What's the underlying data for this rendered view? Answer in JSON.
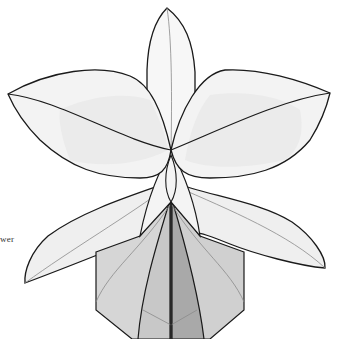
{
  "diagram": {
    "caption_fragment": "wer",
    "colors": {
      "outline": "#1a1a1a",
      "crease": "#8a8a8a",
      "petal_fill": "#f2f2f2",
      "petal_shade": "#e9e9e9",
      "pot_light": "#d6d6d6",
      "pot_mid": "#c8c8c8",
      "pot_dark": "#a9a9a9",
      "background": "#ffffff"
    },
    "parts": [
      "top-sepal",
      "left-petal",
      "right-petal",
      "left-lower-sepal",
      "right-lower-sepal",
      "column",
      "lip-pot"
    ]
  }
}
